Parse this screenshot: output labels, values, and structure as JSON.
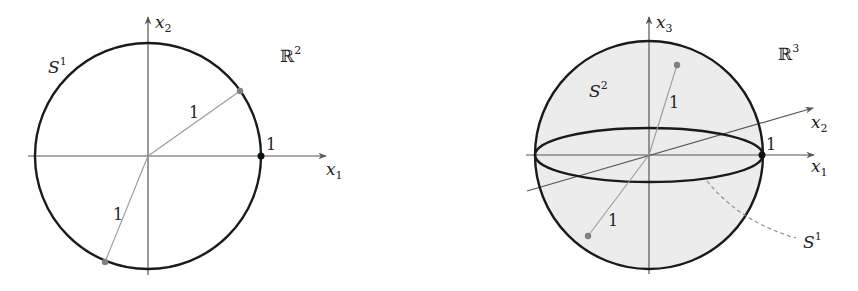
{
  "figures": [
    {
      "id": "circle-r2",
      "space_label": "ℝ",
      "space_exp": "2",
      "shape_label": "S",
      "shape_exp": "1",
      "axes": [
        {
          "name": "x",
          "sub": "1"
        },
        {
          "name": "x",
          "sub": "2"
        }
      ],
      "unit_point_label": "1",
      "radius_labels": [
        "1",
        "1"
      ]
    },
    {
      "id": "sphere-r3",
      "space_label": "ℝ",
      "space_exp": "3",
      "shape_label": "S",
      "shape_exp": "2",
      "equator_label": "S",
      "equator_exp": "1",
      "axes": [
        {
          "name": "x",
          "sub": "1"
        },
        {
          "name": "x",
          "sub": "2"
        },
        {
          "name": "x",
          "sub": "3"
        }
      ],
      "unit_point_label": "1",
      "radius_labels": [
        "1",
        "1"
      ]
    }
  ],
  "colors": {
    "outline": "#1a1a1a",
    "axis": "#555555",
    "radius": "#9a9a9a",
    "point": "#808080",
    "fill": "#ececec"
  }
}
